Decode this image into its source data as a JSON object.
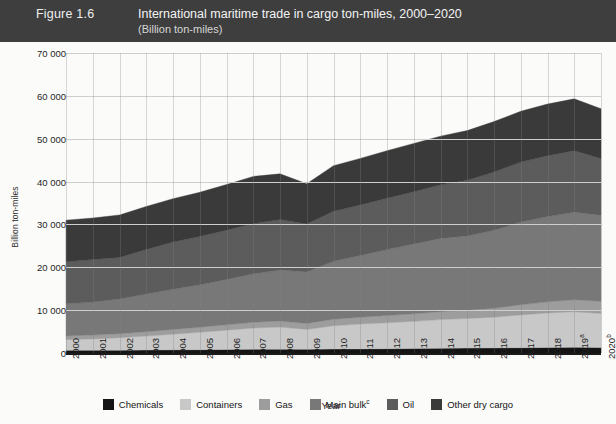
{
  "header": {
    "figure_number": "Figure 1.6",
    "title": "International maritime trade in cargo ton-miles, 2000–2020",
    "subtitle": "(Billion ton-miles)",
    "bar_color": "#3e3e3e",
    "text_color": "#f2f2f2"
  },
  "chart_data": {
    "type": "area",
    "stacked": true,
    "title": "International maritime trade in cargo ton-miles, 2000–2020",
    "subtitle": "(Billion ton-miles)",
    "xlabel": "Year",
    "ylabel": "Billion ton-miles",
    "ylim": [
      0,
      70000
    ],
    "ytick_values": [
      0,
      10000,
      20000,
      30000,
      40000,
      50000,
      60000,
      70000
    ],
    "ytick_labels": [
      "0",
      "10 000",
      "20 000",
      "30 000",
      "40 000",
      "50 000",
      "60 000",
      "70 000"
    ],
    "grid": true,
    "legend_position": "bottom",
    "categories": [
      "2000",
      "2001",
      "2002",
      "2003",
      "2004",
      "2005",
      "2006",
      "2007",
      "2008",
      "2009",
      "2010",
      "2011",
      "2012",
      "2013",
      "2014",
      "2015",
      "2016",
      "2017",
      "2018",
      "2019",
      "2020"
    ],
    "xtick_labels": [
      "2000",
      "2001",
      "2002",
      "2003",
      "2004",
      "2005",
      "2006",
      "2007",
      "2008",
      "2009",
      "2010",
      "2011",
      "2012",
      "2013",
      "2014",
      "2015",
      "2016",
      "2017",
      "2018",
      "2019",
      "2020"
    ],
    "xtick_superscripts": [
      "",
      "",
      "",
      "",
      "",
      "",
      "",
      "",
      "",
      "",
      "",
      "",
      "",
      "",
      "",
      "",
      "",
      "",
      "",
      "a",
      "b"
    ],
    "series": [
      {
        "name": "Chemicals",
        "color": "#141414",
        "values": [
          620,
          640,
          660,
          700,
          740,
          780,
          820,
          870,
          900,
          860,
          930,
          960,
          1000,
          1040,
          1090,
          1140,
          1190,
          1240,
          1290,
          1320,
          1270
        ]
      },
      {
        "name": "Containers",
        "color": "#c8c8c8",
        "values": [
          2500,
          2650,
          2900,
          3250,
          3650,
          4050,
          4500,
          4950,
          5150,
          4650,
          5400,
          5800,
          6050,
          6350,
          6700,
          6900,
          7150,
          7650,
          8050,
          8300,
          7950
        ]
      },
      {
        "name": "Gas",
        "color": "#9d9d9d",
        "values": [
          850,
          900,
          950,
          1020,
          1100,
          1180,
          1250,
          1350,
          1420,
          1400,
          1550,
          1600,
          1680,
          1750,
          1850,
          1950,
          2100,
          2350,
          2600,
          2800,
          2850
        ]
      },
      {
        "name": "Main bulk",
        "color": "#787878",
        "values": [
          7500,
          7700,
          8100,
          8800,
          9400,
          9900,
          10600,
          11300,
          11900,
          12000,
          13500,
          14400,
          15400,
          16300,
          17100,
          17300,
          18200,
          19300,
          19900,
          20400,
          20100
        ]
      },
      {
        "name": "Oil",
        "color": "#5c5c5c",
        "values": [
          9800,
          9900,
          9700,
          10400,
          11000,
          11300,
          11500,
          11700,
          11800,
          11200,
          11700,
          11800,
          12000,
          12200,
          12500,
          13000,
          13600,
          14000,
          14200,
          14400,
          13200
        ]
      },
      {
        "name": "Other dry cargo",
        "color": "#3a3a3a",
        "values": [
          9730,
          9710,
          9890,
          10030,
          10110,
          10290,
          10630,
          11030,
          10630,
          9390,
          10620,
          10840,
          11070,
          11260,
          11360,
          11610,
          11760,
          11860,
          12060,
          12080,
          11630
        ]
      }
    ],
    "totals": [
      31000,
      31500,
      32200,
      34200,
      36000,
      37500,
      39300,
      41200,
      41800,
      39500,
      43700,
      45400,
      47200,
      48900,
      50600,
      51900,
      54000,
      56400,
      58100,
      59300,
      57000
    ]
  },
  "legend": {
    "items": [
      {
        "label": "Chemicals",
        "sup": "",
        "color": "#141414"
      },
      {
        "label": "Containers",
        "sup": "",
        "color": "#c8c8c8"
      },
      {
        "label": "Gas",
        "sup": "",
        "color": "#9d9d9d"
      },
      {
        "label": "Main bulk",
        "sup": "c",
        "color": "#787878"
      },
      {
        "label": "Oil",
        "sup": "",
        "color": "#5c5c5c"
      },
      {
        "label": "Other dry cargo",
        "sup": "",
        "color": "#3a3a3a"
      }
    ]
  }
}
